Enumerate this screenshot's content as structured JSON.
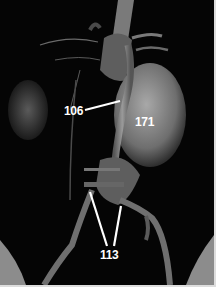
{
  "image": {
    "description": "3D volume-rendered CT angiography of abdominal vasculature with annotated structures",
    "labels": [
      {
        "id": "label-106",
        "text": "106"
      },
      {
        "id": "label-171",
        "text": "171"
      },
      {
        "id": "label-113",
        "text": "113"
      }
    ],
    "colors": {
      "background": "#050505",
      "tissue": "#8a8a8a",
      "label": "#ffffff"
    }
  }
}
